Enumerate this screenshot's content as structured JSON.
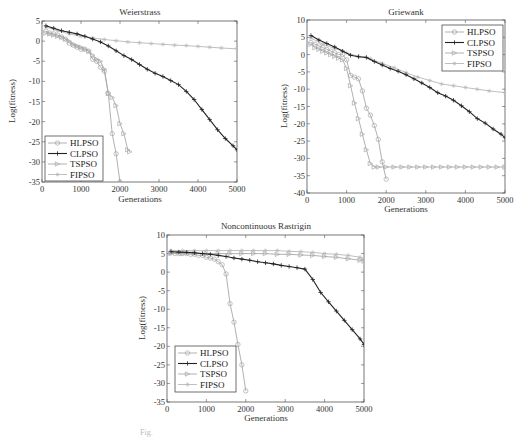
{
  "figure": {
    "caption_partial": "Fig."
  },
  "legend_entries": [
    "HLPSO",
    "CLPSO",
    "TSPSO",
    "FIPSO"
  ],
  "series_styles": {
    "HLPSO": {
      "color": "#a8a8a8",
      "marker": "o",
      "width": 0.9
    },
    "CLPSO": {
      "color": "#222222",
      "marker": "+",
      "width": 1.1
    },
    "TSPSO": {
      "color": "#a8a8a8",
      "marker": ">",
      "width": 0.9
    },
    "FIPSO": {
      "color": "#b8b8b8",
      "marker": "*",
      "width": 0.9
    }
  },
  "chart_data": [
    {
      "type": "line",
      "title": "Weierstrass",
      "xlabel": "Generations",
      "ylabel": "Log(fitness)",
      "xlim": [
        0,
        5000
      ],
      "ylim": [
        -35,
        5
      ],
      "xticks": [
        0,
        1000,
        2000,
        3000,
        4000,
        5000
      ],
      "yticks": [
        5,
        0,
        -5,
        -10,
        -15,
        -20,
        -25,
        -30,
        -35
      ],
      "grid": false,
      "legend_position": "lower left",
      "box": {
        "left": 42,
        "top": 21,
        "right": 237,
        "bottom": 182
      },
      "legend_box": {
        "x": 45,
        "y": 136,
        "w": 58,
        "h": 45
      },
      "series": [
        {
          "name": "HLPSO",
          "x": [
            100,
            200,
            300,
            400,
            500,
            600,
            700,
            800,
            900,
            1000,
            1100,
            1200,
            1300,
            1400,
            1500,
            1600,
            1700,
            1800,
            1900,
            2000
          ],
          "values": [
            2.5,
            2,
            1.8,
            1.5,
            1,
            0.5,
            -0.5,
            -1,
            -1.5,
            -2,
            -2,
            -2.5,
            -4.5,
            -5,
            -6.5,
            -7.5,
            -13,
            -23,
            -28,
            -35
          ]
        },
        {
          "name": "CLPSO",
          "x": [
            100,
            300,
            500,
            700,
            900,
            1100,
            1300,
            1500,
            1700,
            1900,
            2100,
            2300,
            2500,
            2700,
            2900,
            3100,
            3300,
            3500,
            3700,
            3900,
            4100,
            4300,
            4500,
            4700,
            4900,
            5000
          ],
          "values": [
            3.8,
            3.2,
            2.6,
            2.2,
            1.8,
            1.2,
            0.5,
            -0.2,
            -1.2,
            -2.4,
            -3.6,
            -4.6,
            -5.8,
            -7,
            -8,
            -8.8,
            -9.8,
            -10.8,
            -12.5,
            -14.5,
            -17,
            -19.5,
            -22,
            -24.2,
            -26,
            -27
          ]
        },
        {
          "name": "TSPSO",
          "x": [
            100,
            200,
            300,
            400,
            500,
            600,
            700,
            800,
            900,
            1000,
            1100,
            1200,
            1300,
            1400,
            1500,
            1600,
            1700,
            1800,
            1900,
            2000,
            2100,
            2200,
            2250
          ],
          "values": [
            2,
            1.8,
            1.5,
            1.2,
            1,
            0.5,
            0,
            -0.8,
            -1.2,
            -1.5,
            -2,
            -2.5,
            -3.5,
            -4.5,
            -5,
            -7,
            -13,
            -14,
            -16,
            -20.5,
            -23,
            -27,
            -27.5
          ]
        },
        {
          "name": "FIPSO",
          "x": [
            100,
            400,
            700,
            1000,
            1300,
            1600,
            1900,
            2200,
            2500,
            2800,
            3100,
            3400,
            3700,
            4000,
            4300,
            4600,
            5000
          ],
          "values": [
            3.5,
            2.6,
            1.8,
            1.2,
            0.8,
            0.4,
            0.1,
            -0.2,
            -0.4,
            -0.6,
            -0.8,
            -1,
            -1.1,
            -1.3,
            -1.5,
            -1.7,
            -1.9
          ]
        }
      ]
    },
    {
      "type": "line",
      "title": "Griewank",
      "xlabel": "Generations",
      "ylabel": "Log(fitness)",
      "xlim": [
        0,
        5000
      ],
      "ylim": [
        -40,
        10
      ],
      "xticks": [
        0,
        1000,
        2000,
        3000,
        4000,
        5000
      ],
      "yticks": [
        10,
        5,
        0,
        -5,
        -10,
        -15,
        -20,
        -25,
        -30,
        -35,
        -40
      ],
      "grid": false,
      "legend_position": "upper right",
      "box": {
        "left": 307,
        "top": 20,
        "right": 505,
        "bottom": 193
      },
      "legend_box": {
        "x": 442,
        "y": 25,
        "w": 61,
        "h": 46
      },
      "series": [
        {
          "name": "HLPSO",
          "x": [
            100,
            200,
            300,
            400,
            500,
            600,
            700,
            800,
            900,
            1000,
            1100,
            1200,
            1300,
            1400,
            1500,
            1600,
            1700,
            1800,
            1900,
            2000
          ],
          "values": [
            3.5,
            3,
            2.5,
            2,
            1.5,
            1,
            0.5,
            0,
            0,
            -1.5,
            -6,
            -6.5,
            -7,
            -10.5,
            -15.5,
            -17.5,
            -20.5,
            -24.5,
            -31,
            -36
          ]
        },
        {
          "name": "CLPSO",
          "x": [
            100,
            300,
            500,
            700,
            900,
            1100,
            1300,
            1500,
            1700,
            1900,
            2100,
            2300,
            2500,
            2700,
            2900,
            3100,
            3300,
            3500,
            3700,
            3900,
            4100,
            4300,
            4500,
            4700,
            4900,
            5000
          ],
          "values": [
            5.5,
            4.2,
            3.2,
            2.2,
            1,
            -0.2,
            -0.6,
            -0.8,
            -2,
            -3,
            -4,
            -4.8,
            -5.8,
            -7,
            -8.2,
            -9.5,
            -11,
            -12,
            -13.2,
            -14.8,
            -16.5,
            -18.5,
            -19.8,
            -21.5,
            -23,
            -24
          ]
        },
        {
          "name": "TSPSO",
          "x": [
            100,
            200,
            300,
            400,
            500,
            600,
            700,
            800,
            900,
            1000,
            1100,
            1200,
            1300,
            1400,
            1500,
            1600,
            1700,
            1800,
            2000,
            2200,
            2400,
            2600,
            2800,
            3000,
            3200,
            3400,
            3600,
            3800,
            4000,
            4200,
            4400,
            4600,
            4800,
            5000
          ],
          "values": [
            3,
            2,
            1.5,
            1,
            0.5,
            0,
            -0.5,
            -1,
            -1.5,
            -4,
            -9,
            -14,
            -18.5,
            -23,
            -27.5,
            -31.5,
            -32.5,
            -32.5,
            -32.5,
            -32.5,
            -32.5,
            -32.5,
            -32.5,
            -32.5,
            -32.5,
            -32.5,
            -32.5,
            -32.5,
            -32.5,
            -32.5,
            -32.5,
            -32.5,
            -32.5,
            -32.5
          ]
        },
        {
          "name": "FIPSO",
          "x": [
            100,
            400,
            700,
            1000,
            1300,
            1600,
            1900,
            2200,
            2500,
            2800,
            3100,
            3400,
            3700,
            4000,
            4300,
            4600,
            5000
          ],
          "values": [
            4.8,
            3,
            1.8,
            0.5,
            -0.5,
            -1.2,
            -2.5,
            -3.8,
            -5.2,
            -6.5,
            -7.5,
            -8.5,
            -9,
            -9.5,
            -10,
            -10.5,
            -11
          ]
        }
      ]
    },
    {
      "type": "line",
      "title": "Noncontinuous Rastrigin",
      "xlabel": "Generations",
      "ylabel": "Log(fitness)",
      "xlim": [
        0,
        5000
      ],
      "ylim": [
        -35,
        10
      ],
      "xticks": [
        0,
        1000,
        2000,
        3000,
        4000,
        5000
      ],
      "yticks": [
        10,
        5,
        0,
        -5,
        -10,
        -15,
        -20,
        -25,
        -30,
        -35
      ],
      "grid": false,
      "legend_position": "lower left",
      "box": {
        "left": 167,
        "top": 235,
        "right": 364,
        "bottom": 402
      },
      "legend_box": {
        "x": 175,
        "y": 346,
        "w": 61,
        "h": 46
      },
      "series": [
        {
          "name": "HLPSO",
          "x": [
            100,
            200,
            300,
            400,
            500,
            600,
            700,
            800,
            900,
            1000,
            1100,
            1200,
            1300,
            1400,
            1500,
            1600,
            1700,
            1800,
            1900,
            2000
          ],
          "values": [
            5.2,
            5,
            5,
            5,
            5,
            4.8,
            4.8,
            4.5,
            4.5,
            4,
            3.8,
            3.5,
            2.8,
            2,
            -0.5,
            -8.5,
            -13.5,
            -19.5,
            -25,
            -32
          ]
        },
        {
          "name": "CLPSO",
          "x": [
            100,
            300,
            500,
            700,
            900,
            1100,
            1300,
            1500,
            1700,
            1900,
            2100,
            2300,
            2500,
            2700,
            2900,
            3100,
            3300,
            3500,
            3700,
            3900,
            4100,
            4300,
            4500,
            4700,
            4900,
            5000
          ],
          "values": [
            5.5,
            5.4,
            5.3,
            5.2,
            5,
            4.8,
            4.5,
            4.2,
            3.8,
            3.5,
            3.2,
            2.8,
            2.5,
            2.2,
            1.8,
            1.5,
            1.2,
            0.8,
            -2,
            -5.5,
            -8,
            -10.5,
            -13,
            -15.5,
            -18,
            -19.5
          ]
        },
        {
          "name": "TSPSO",
          "x": [
            100,
            400,
            700,
            1000,
            1300,
            1600,
            1900,
            2200,
            2500,
            2800,
            3100,
            3400,
            3700,
            4000,
            4300,
            4600,
            4900,
            5000
          ],
          "values": [
            5,
            5,
            5,
            5,
            5,
            5,
            5,
            5,
            5,
            4.8,
            4.8,
            4.6,
            4.5,
            4.2,
            4,
            3.6,
            3.2,
            3
          ]
        },
        {
          "name": "FIPSO",
          "x": [
            100,
            400,
            700,
            1000,
            1300,
            1600,
            1900,
            2200,
            2500,
            2800,
            3100,
            3400,
            3700,
            4000,
            4300,
            4600,
            4900,
            5000
          ],
          "values": [
            5.8,
            5.8,
            5.8,
            5.8,
            5.8,
            5.8,
            5.8,
            5.8,
            5.8,
            5.8,
            5.6,
            5.5,
            5.3,
            5,
            4.8,
            4.5,
            4,
            3.6
          ]
        }
      ]
    }
  ]
}
